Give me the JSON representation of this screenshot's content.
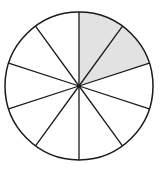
{
  "diagram": {
    "type": "fraction-circle",
    "total_sectors": 10,
    "shaded_sectors": 2,
    "shaded_indices": [
      0,
      1
    ],
    "center": [
      79,
      86
    ],
    "radius": 74,
    "start_angle_deg": 0,
    "direction": "clockwise",
    "colors": {
      "shade": "#e2e2e2",
      "stroke": "#1a1a1a",
      "background": "#ffffff"
    }
  }
}
